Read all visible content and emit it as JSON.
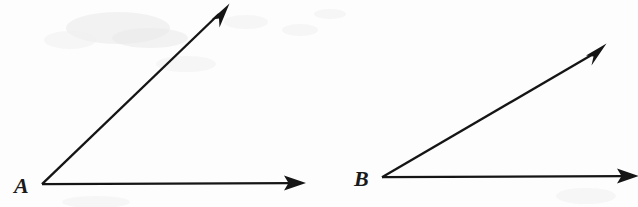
{
  "figure": {
    "background_color": "#fdfdfd",
    "ink_color": "#151515",
    "width": 638,
    "height": 207,
    "angles": [
      {
        "id": "angle-a",
        "vertex_label": "A",
        "vertex": {
          "x": 42,
          "y": 184
        },
        "label_position": {
          "x": 14,
          "y": 193
        },
        "measure_degrees": 44,
        "rays": [
          {
            "id": "ray-a-horizontal",
            "name": "horizontal-ray",
            "from": {
              "x": 42,
              "y": 184
            },
            "to": {
              "x": 305,
              "y": 183
            },
            "direction_degrees": 0
          },
          {
            "id": "ray-a-diagonal",
            "name": "diagonal-ray",
            "from": {
              "x": 42,
              "y": 184
            },
            "to": {
              "x": 229,
              "y": 4
            },
            "direction_degrees": 44
          }
        ]
      },
      {
        "id": "angle-b",
        "vertex_label": "B",
        "vertex": {
          "x": 382,
          "y": 177
        },
        "label_position": {
          "x": 354,
          "y": 186
        },
        "measure_degrees": 30,
        "rays": [
          {
            "id": "ray-b-horizontal",
            "name": "horizontal-ray",
            "from": {
              "x": 382,
              "y": 177
            },
            "to": {
              "x": 640,
              "y": 176
            },
            "direction_degrees": 0
          },
          {
            "id": "ray-b-diagonal",
            "name": "diagonal-ray",
            "from": {
              "x": 382,
              "y": 177
            },
            "to": {
              "x": 606,
              "y": 44
            },
            "direction_degrees": 30
          }
        ]
      }
    ]
  }
}
